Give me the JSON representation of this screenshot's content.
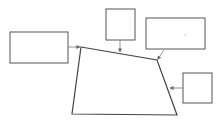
{
  "diagram": {
    "colors": {
      "stroke": "#555555",
      "connector": "#777777",
      "background": "#ffffff"
    },
    "boxes": [
      {
        "id": "box-left",
        "label": ""
      },
      {
        "id": "box-top-middle",
        "label": ""
      },
      {
        "id": "box-top-right",
        "label": ""
      },
      {
        "id": "box-right",
        "label": ""
      }
    ],
    "shape": {
      "type": "quadrilateral",
      "label": ""
    },
    "connectors": [
      {
        "from": "box-left",
        "to": "top-left-vertex"
      },
      {
        "from": "box-top-middle",
        "to": "top-edge"
      },
      {
        "from": "box-top-right",
        "to": "top-right-vertex"
      },
      {
        "from": "box-right",
        "to": "right-edge"
      }
    ]
  }
}
